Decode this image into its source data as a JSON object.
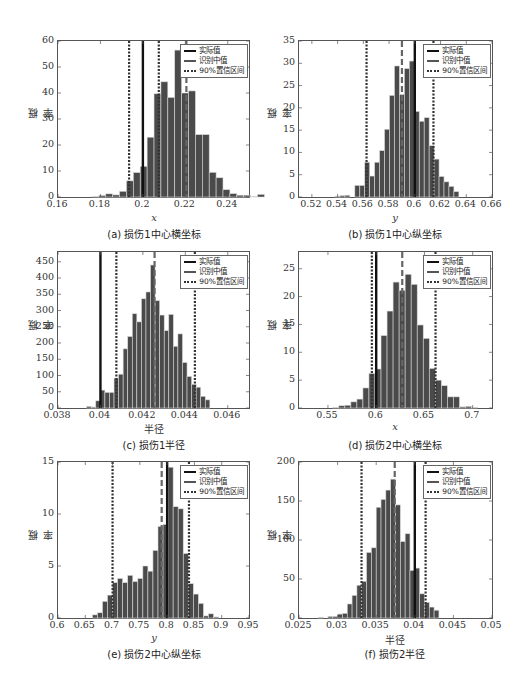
{
  "legend": {
    "actual": "实际值",
    "median": "识别中值",
    "ci": "90%置信区间"
  },
  "colors": {
    "bar_fill": "#4a4a4a",
    "bar_edge": "#d8d8d8",
    "actual_line": "#111111",
    "median_line": "#666666",
    "ci_line": "#333333"
  },
  "chart_data": [
    {
      "id": "a",
      "type": "bar",
      "title": "(a) 损伤1中心横坐标",
      "xlabel": "x",
      "ylabel": "概率",
      "xlim": [
        0.16,
        0.25
      ],
      "ylim": [
        0,
        60
      ],
      "xticks": [
        0.16,
        0.18,
        0.2,
        0.22,
        0.24
      ],
      "xtick_labels": [
        "0.16",
        "0.18",
        "0.2",
        "0.22",
        "0.24"
      ],
      "yticks": [
        0,
        10,
        20,
        30,
        40,
        50,
        60
      ],
      "bin_start": 0.176,
      "bin_width": 0.00325,
      "values": [
        0.2,
        0.6,
        1.2,
        0.8,
        2.2,
        6.2,
        9.4,
        11.8,
        23.0,
        39.7,
        44.3,
        38.3,
        56.5,
        40.0,
        40.8,
        24.0,
        24.0,
        9.5,
        7.4,
        2.8,
        1.3,
        0.7,
        0.7,
        0.2,
        1.0
      ],
      "actual": 0.2,
      "median": 0.2205,
      "ci": [
        0.1935,
        0.2075
      ],
      "legend_position": "upper right",
      "grid": false
    },
    {
      "id": "b",
      "type": "bar",
      "title": "(b) 损伤1中心纵坐标",
      "xlabel": "y",
      "ylabel": "概率",
      "xlim": [
        0.51,
        0.66
      ],
      "ylim": [
        0,
        35
      ],
      "xticks": [
        0.52,
        0.54,
        0.56,
        0.58,
        0.6,
        0.62,
        0.64,
        0.66
      ],
      "xtick_labels": [
        "0.52",
        "0.54",
        "0.56",
        "0.58",
        "0.6",
        "0.62",
        "0.64",
        "0.66"
      ],
      "yticks": [
        0,
        5,
        10,
        15,
        20,
        25,
        30,
        35
      ],
      "bin_start": 0.538,
      "bin_width": 0.00385,
      "values": [
        0.2,
        0.3,
        0.4,
        0,
        2.6,
        2.6,
        7.8,
        4.7,
        7.8,
        10.4,
        15.2,
        22.8,
        29.4,
        23.0,
        28.8,
        30.5,
        19.2,
        17.0,
        17.8,
        11.5,
        8.5,
        4.6,
        3.4,
        2.4,
        1.2
      ],
      "bin_start_override_note": "",
      "actual": 0.6,
      "median": 0.59,
      "ci": [
        0.5625,
        0.6145
      ],
      "legend_position": "upper right",
      "grid": false
    },
    {
      "id": "c",
      "type": "bar",
      "title": "(c) 损伤1半径",
      "xlabel": "半径",
      "ylabel": "概率",
      "xlim": [
        0.038,
        0.047
      ],
      "ylim": [
        0,
        480
      ],
      "xticks": [
        0.038,
        0.04,
        0.042,
        0.044,
        0.046
      ],
      "xtick_labels": [
        "0.038",
        "0.04",
        "0.042",
        "0.044",
        "0.046"
      ],
      "yticks": [
        0,
        50,
        100,
        150,
        200,
        250,
        300,
        350,
        400,
        450
      ],
      "bin_start": 0.03935,
      "bin_width": 0.000215,
      "values": [
        5,
        3,
        22,
        55,
        48,
        48,
        92,
        104,
        182,
        220,
        290,
        265,
        336,
        357,
        440,
        330,
        286,
        238,
        288,
        190,
        228,
        140,
        97,
        73,
        64,
        36,
        25
      ],
      "actual": 0.04,
      "median": 0.04255,
      "ci": [
        0.04075,
        0.04445
      ],
      "legend_position": "upper right",
      "grid": false
    },
    {
      "id": "d",
      "type": "bar",
      "title": "(d) 损伤2中心横坐标",
      "xlabel": "x",
      "ylabel": "概率",
      "xlim": [
        0.52,
        0.72
      ],
      "ylim": [
        0,
        28
      ],
      "xticks": [
        0.55,
        0.6,
        0.65,
        0.7
      ],
      "xtick_labels": [
        "0.55",
        "0.6",
        "0.65",
        "0.7"
      ],
      "yticks": [
        0,
        5,
        10,
        15,
        20,
        25
      ],
      "bin_start": 0.555,
      "bin_width": 0.00625,
      "values": [
        0.1,
        0.4,
        0.5,
        1.1,
        1.6,
        3.6,
        6.2,
        7.0,
        13.0,
        17.4,
        22.6,
        21.1,
        24.0,
        22.2,
        14.9,
        12.5,
        7.1,
        5.0,
        4.0,
        2.0,
        2.0,
        0.2,
        0.3,
        0.1
      ],
      "actual": 0.6,
      "median": 0.627,
      "ci": [
        0.5955,
        0.6615
      ],
      "legend_position": "upper right",
      "grid": false
    },
    {
      "id": "e",
      "type": "bar",
      "title": "(e) 损伤2中心纵坐标",
      "xlabel": "y",
      "ylabel": "概率",
      "xlim": [
        0.6,
        0.95
      ],
      "ylim": [
        0,
        15
      ],
      "xticks": [
        0.6,
        0.65,
        0.7,
        0.75,
        0.8,
        0.85,
        0.9,
        0.95
      ],
      "xtick_labels": [
        "0.6",
        "0.65",
        "0.7",
        "0.75",
        "0.8",
        "0.85",
        "0.9",
        "0.95"
      ],
      "yticks": [
        0,
        5,
        10,
        15
      ],
      "bin_start": 0.663,
      "bin_width": 0.00925,
      "values": [
        0.3,
        0.5,
        1.6,
        2.2,
        3.4,
        3.8,
        3.4,
        4.1,
        3.5,
        3.8,
        5.0,
        4.5,
        6.5,
        8.8,
        9.0,
        14.5,
        10.7,
        10.5,
        6.2,
        3.3,
        2.3,
        1.4,
        0.2,
        0.4,
        0.1
      ],
      "actual": 0.8,
      "median": 0.79,
      "ci": [
        0.7,
        0.84
      ],
      "legend_position": "upper right",
      "grid": false
    },
    {
      "id": "f",
      "type": "bar",
      "title": "(f) 损伤2半径",
      "xlabel": "半径",
      "ylabel": "概率",
      "xlim": [
        0.025,
        0.05
      ],
      "ylim": [
        0,
        200
      ],
      "xticks": [
        0.025,
        0.03,
        0.035,
        0.04,
        0.045,
        0.05
      ],
      "xtick_labels": [
        "0.025",
        "0.03",
        "0.035",
        "0.04",
        "0.045",
        "0.05"
      ],
      "yticks": [
        0,
        50,
        100,
        150,
        200
      ],
      "bin_start": 0.0275,
      "bin_width": 0.000625,
      "values": [
        1,
        0,
        2,
        2,
        5,
        6,
        18,
        29,
        42,
        47,
        84,
        90,
        142,
        152,
        164,
        178,
        145,
        98,
        108,
        61,
        64,
        31,
        20,
        14,
        10
      ],
      "actual": 0.04,
      "median": 0.0374,
      "ci": [
        0.0331,
        0.0414
      ],
      "legend_position": "upper right",
      "grid": false
    }
  ]
}
